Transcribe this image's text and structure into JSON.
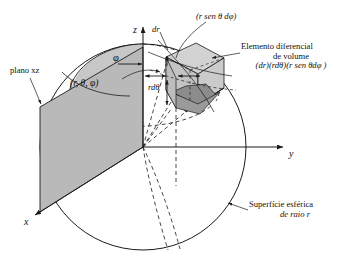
{
  "figure": {
    "type": "spherical-coordinates-volume-element-diagram",
    "language": "pt-BR",
    "background_color": "#ffffff",
    "line_color": "#1a1a1a",
    "fill_plane_color": "#b9b9b9",
    "fill_cone_color": "#c6c6c6",
    "fill_box_light_color": "#cfcfcf",
    "fill_box_mid_color": "#b0b0b0",
    "fill_box_dark_color": "#8e8e8e"
  },
  "axes": {
    "z_label": "z",
    "y_label": "y",
    "x_label": "x"
  },
  "annotations": {
    "plane_xz": "plano xz",
    "coordinate_triple": "(r, θ, φ)",
    "azimuth_angle": "φ",
    "dr": "dr",
    "r_dtheta": "rdθ",
    "arc_r_sin_theta_dphi": "(r sen θ dφ)",
    "volume_element_line1": "Elemento diferencial",
    "volume_element_line2": "de volume",
    "volume_element_line3": "(dr)(rdθ)(r sen θdφ )",
    "sphere_surface_line1": "Superfície esférica",
    "sphere_surface_line2": "de raio r"
  },
  "geometry": {
    "sphere_center": [
      143,
      147
    ],
    "sphere_radius": 103,
    "origin": [
      143,
      147
    ],
    "z_axis_top": [
      143,
      26
    ],
    "y_axis_right": [
      288,
      147
    ],
    "x_axis_end": [
      40,
      212
    ]
  }
}
